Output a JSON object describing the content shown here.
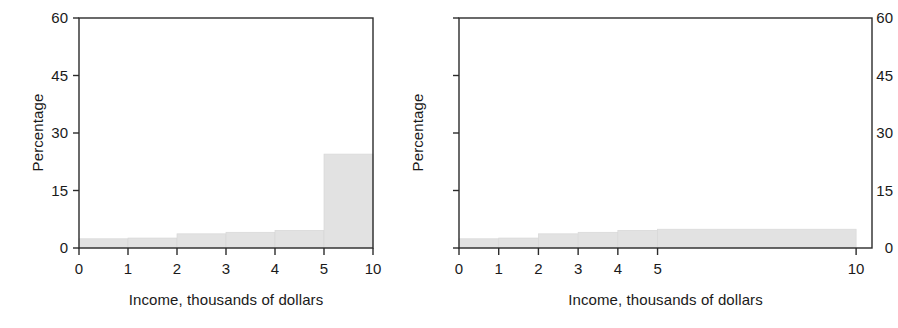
{
  "figure": {
    "background": "#ffffff",
    "axis_color": "#2b2b2b",
    "bar_fill": "#e2e2e2",
    "bar_edge": "#d8d8d8",
    "text_color": "#1a1a1a"
  },
  "panels": [
    {
      "id": "left",
      "name": "histogram-unequal-bin-widths-drawn-equal",
      "ylabel": "Percentage",
      "xlabel": "Income, thousands of dollars",
      "yticks": [
        "0",
        "15",
        "30",
        "45",
        "60"
      ],
      "xticks": [
        "0",
        "1",
        "2",
        "3",
        "4",
        "5",
        "10"
      ]
    },
    {
      "id": "right",
      "name": "histogram-linear-income-scale",
      "ylabel": "Percentage",
      "xlabel": "Income, thousands of dollars",
      "yticks": [
        "0",
        "15",
        "30",
        "45",
        "60"
      ],
      "xticks": [
        "0",
        "1",
        "2",
        "3",
        "4",
        "5",
        "10"
      ]
    }
  ],
  "chart_data": [
    {
      "type": "bar",
      "title": "",
      "subtitle": "",
      "xlabel": "Income, thousands of dollars",
      "ylabel": "Percentage",
      "xlim": [
        0,
        6
      ],
      "ylim": [
        0,
        60
      ],
      "ytick_values": [
        0,
        15,
        30,
        45,
        60
      ],
      "xtick_labels": [
        "0",
        "1",
        "2",
        "3",
        "4",
        "5",
        "10"
      ],
      "xtick_positions": [
        0,
        1,
        2,
        3,
        4,
        5,
        6
      ],
      "grid": false,
      "legend": "none",
      "note": "Bins of unequal income width drawn with equal plotted width; last bin spans 5-10 thousand",
      "bins": [
        {
          "label": "0-1",
          "x_start": 0,
          "x_end": 1,
          "value": 2.4
        },
        {
          "label": "1-2",
          "x_start": 1,
          "x_end": 2,
          "value": 2.6
        },
        {
          "label": "2-3",
          "x_start": 2,
          "x_end": 3,
          "value": 3.7
        },
        {
          "label": "3-4",
          "x_start": 3,
          "x_end": 4,
          "value": 4.1
        },
        {
          "label": "4-5",
          "x_start": 4,
          "x_end": 5,
          "value": 4.6
        },
        {
          "label": "5-10",
          "x_start": 5,
          "x_end": 6,
          "value": 24.5
        }
      ],
      "categories": [
        "0-1",
        "1-2",
        "2-3",
        "3-4",
        "4-5",
        "5-10"
      ],
      "values": [
        2.4,
        2.6,
        3.7,
        4.1,
        4.6,
        24.5
      ]
    },
    {
      "type": "bar",
      "title": "",
      "subtitle": "",
      "xlabel": "Income, thousands of dollars",
      "ylabel": "Percentage",
      "xlim": [
        0,
        10.4
      ],
      "ylim": [
        0,
        60
      ],
      "ytick_values": [
        0,
        15,
        30,
        45,
        60
      ],
      "xtick_labels": [
        "0",
        "1",
        "2",
        "3",
        "4",
        "5",
        "10"
      ],
      "xtick_positions": [
        0,
        1,
        2,
        3,
        4,
        5,
        10
      ],
      "grid": false,
      "legend": "none",
      "note": "Same data on a true linear income axis; the 5-10 bin is five units wide and low",
      "bins": [
        {
          "label": "0-1",
          "x_start": 0,
          "x_end": 1,
          "value": 2.4
        },
        {
          "label": "1-2",
          "x_start": 1,
          "x_end": 2,
          "value": 2.6
        },
        {
          "label": "2-3",
          "x_start": 2,
          "x_end": 3,
          "value": 3.7
        },
        {
          "label": "3-4",
          "x_start": 3,
          "x_end": 4,
          "value": 4.1
        },
        {
          "label": "4-5",
          "x_start": 4,
          "x_end": 5,
          "value": 4.6
        },
        {
          "label": "5-10",
          "x_start": 5,
          "x_end": 10,
          "value": 4.9
        }
      ],
      "categories": [
        "0-1",
        "1-2",
        "2-3",
        "3-4",
        "4-5",
        "5-10"
      ],
      "values": [
        2.4,
        2.6,
        3.7,
        4.1,
        4.6,
        4.9
      ]
    }
  ]
}
